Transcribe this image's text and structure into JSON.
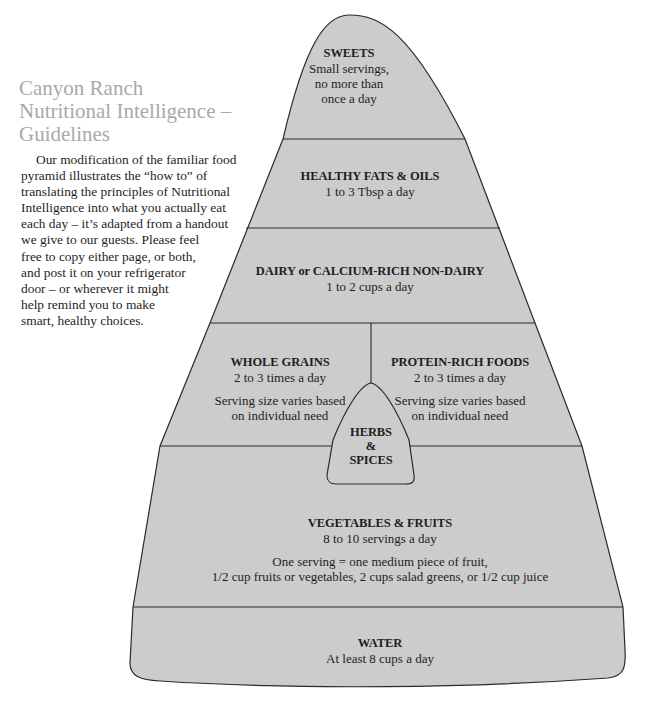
{
  "title": {
    "lines": [
      "Canyon Ranch",
      "Nutritional Intelligence –",
      "Guidelines"
    ]
  },
  "intro": {
    "lines": [
      "Our modification of the familiar food",
      "pyramid illustrates the “how to” of",
      "translating the principles of Nutritional",
      "Intelligence into what you actually eat",
      "each day – it’s adapted from a handout",
      "we give to our guests. Please feel",
      "free to copy either page, or both,",
      "and post it on your refrigerator",
      "door – or wherever it might",
      "help remind you to make",
      "smart, healthy choices."
    ]
  },
  "colors": {
    "fill": "#cccccc",
    "stroke": "#2a2a2a",
    "title": "#a9a9a9"
  },
  "pyramid": {
    "sweets": {
      "heading": "SWEETS",
      "lines": [
        "Small servings,",
        "no more than",
        "once a day"
      ]
    },
    "fats": {
      "heading": "HEALTHY FATS & OILS",
      "amount": "1 to 3 Tbsp a day"
    },
    "dairy": {
      "heading": "DAIRY or CALCIUM-RICH NON-DAIRY",
      "amount": "1 to 2 cups a day"
    },
    "grains": {
      "heading": "WHOLE GRAINS",
      "amount": "2 to 3 times a day",
      "note": [
        "Serving size varies based",
        "on individual need"
      ]
    },
    "protein": {
      "heading": "PROTEIN-RICH FOODS",
      "amount": "2 to 3 times a day",
      "note": [
        "Serving size varies based",
        "on individual need"
      ]
    },
    "herbs": {
      "lines": [
        "HERBS",
        "&",
        "SPICES"
      ]
    },
    "vegetables": {
      "heading": "VEGETABLES & FRUITS",
      "amount": "8 to 10 servings a day",
      "note": [
        "One serving = one medium piece of fruit,",
        "1/2 cup fruits or vegetables, 2 cups salad greens, or 1/2 cup juice"
      ]
    },
    "water": {
      "heading": "WATER",
      "amount": "At least 8 cups a day"
    }
  }
}
